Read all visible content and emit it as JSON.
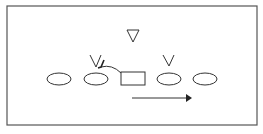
{
  "diagram": {
    "type": "formation-diagram",
    "colors": {
      "background": "#ffffff",
      "stroke": "#333333",
      "border": "#555555"
    },
    "frame": {
      "x": 7,
      "y": 6,
      "width": 250,
      "height": 119
    },
    "ellipses": [
      {
        "id": "player-1",
        "cx": 59,
        "cy": 79,
        "rx": 12,
        "ry": 6
      },
      {
        "id": "player-2",
        "cx": 96,
        "cy": 79,
        "rx": 12,
        "ry": 6
      },
      {
        "id": "player-4",
        "cx": 169,
        "cy": 79,
        "rx": 12,
        "ry": 6
      },
      {
        "id": "player-5",
        "cx": 205,
        "cy": 79,
        "rx": 12,
        "ry": 6
      }
    ],
    "center_box": {
      "x": 121,
      "y": 72,
      "width": 24,
      "height": 13
    },
    "triangle": {
      "points": "127,30 139,30 133,42"
    },
    "v_marks": [
      {
        "id": "defender-left",
        "points": "90,55 96,67 101,55"
      },
      {
        "id": "defender-right",
        "points": "163,55 169,66 174,55"
      }
    ],
    "curved_route": {
      "d": "M121,73 Q112,64 101,67"
    },
    "curved_route_tip": {
      "d": "M104,60 L101,67 L98,68"
    },
    "motion_arrow": {
      "x1": 132,
      "y1": 98,
      "x2": 186,
      "y2": 98,
      "head": "186,94 192,98 186,102"
    }
  }
}
